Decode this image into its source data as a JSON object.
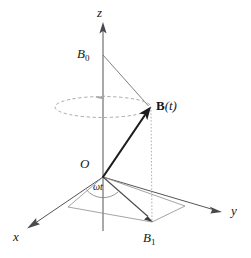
{
  "figure": {
    "background_color": "#ffffff",
    "width": 251,
    "height": 258,
    "axes": [
      {
        "name": "z-axis",
        "label": "z",
        "label_x": 97,
        "label_y": 7,
        "from": [
          103,
          230
        ],
        "to": [
          103,
          24
        ]
      },
      {
        "name": "y-axis",
        "label": "y",
        "label_x": 230,
        "label_y": 205,
        "from": [
          103,
          177
        ],
        "to": [
          221,
          212
        ]
      },
      {
        "name": "x-axis",
        "label": "x",
        "label_x": 13,
        "label_y": 230,
        "from": [
          103,
          177
        ],
        "to": [
          29,
          227
        ]
      }
    ],
    "points": [
      {
        "name": "origin",
        "label": "O",
        "label_x": 80,
        "label_y": 158,
        "x": 103,
        "y": 177
      },
      {
        "name": "b-zero",
        "label": "B",
        "sub": "0",
        "label_x": 78,
        "label_y": 47,
        "x": 103,
        "y": 55
      },
      {
        "name": "b-one",
        "label": "B",
        "sub": "1",
        "label_x": 143,
        "label_y": 231,
        "x": 152,
        "y": 222
      },
      {
        "name": "b-of-t",
        "label_bold": "B",
        "label_rest": "(t)",
        "label_x": 156,
        "label_y": 99,
        "x": 150,
        "y": 108
      }
    ],
    "angle": {
      "name": "omega-t-angle",
      "label": "ωt",
      "label_x": 93,
      "label_y": 182
    },
    "orbit": {
      "name": "precession-circle",
      "center_x": 103,
      "center_y": 107,
      "rx": 48,
      "ry": 10.5,
      "direction": "counterclockwise",
      "color": "#a9a9ae"
    },
    "segments": [
      {
        "name": "b0-to-bt",
        "from": [
          103,
          55
        ],
        "to": [
          150,
          108
        ]
      },
      {
        "name": "bt-to-b1-vertical",
        "from": [
          151,
          108
        ],
        "to": [
          152,
          222
        ]
      },
      {
        "name": "b1-to-origin-base",
        "from": [
          152,
          222
        ],
        "to": [
          103,
          177
        ]
      },
      {
        "name": "base-left-edge",
        "from": [
          103,
          177
        ],
        "to": [
          68,
          207
        ]
      },
      {
        "name": "base-bottom-edge",
        "from": [
          68,
          207
        ],
        "to": [
          152,
          222
        ]
      },
      {
        "name": "base-right-edge",
        "from": [
          152,
          222
        ],
        "to": [
          185,
          206
        ]
      },
      {
        "name": "base-top-edge",
        "from": [
          185,
          206
        ],
        "to": [
          103,
          177
        ]
      }
    ],
    "vectors": [
      {
        "name": "b-of-t-vector",
        "from": [
          103,
          177
        ],
        "to": [
          150,
          108
        ],
        "style": "bold"
      },
      {
        "name": "b-one-projection-vector",
        "from": [
          103,
          177
        ],
        "to": [
          152,
          222
        ],
        "style": "thin"
      }
    ],
    "colors": {
      "vector": "#1c1c20",
      "axis": "#555558",
      "guide": "#6a6a6e",
      "orbit": "#a9a9ae",
      "text": "#16161a"
    }
  }
}
